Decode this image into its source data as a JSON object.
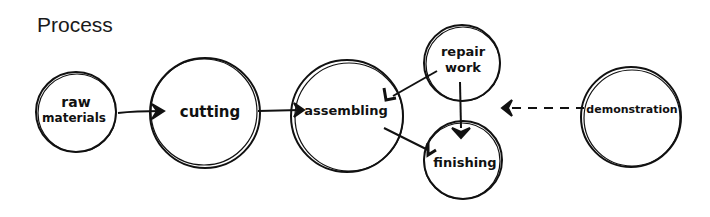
{
  "title": "Process",
  "nodes": [
    {
      "id": "raw",
      "label_lines": [
        "raw",
        "materials"
      ]
    },
    {
      "id": "cutting",
      "label": "cutting"
    },
    {
      "id": "assembling",
      "label": "assembling"
    },
    {
      "id": "repair",
      "label_lines": [
        "repair",
        "work"
      ]
    },
    {
      "id": "finishing",
      "label": "finishing"
    },
    {
      "id": "demonstration",
      "label": "demonstration"
    }
  ],
  "edges": [
    {
      "from": "raw materials",
      "to": "cutting",
      "style": "solid"
    },
    {
      "from": "cutting",
      "to": "assembling",
      "style": "solid"
    },
    {
      "from": "repair work",
      "to": "assembling",
      "style": "solid"
    },
    {
      "from": "assembling",
      "to": "finishing",
      "style": "solid"
    },
    {
      "from": "repair work",
      "to": "finishing",
      "style": "solid"
    },
    {
      "from": "demonstration",
      "to": "finishing area",
      "style": "dashed"
    }
  ]
}
